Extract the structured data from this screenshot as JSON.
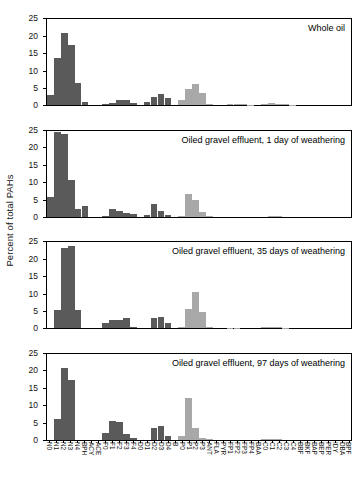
{
  "chart_data": {
    "type": "bar",
    "title": "",
    "ylabel": "Percent of total PAHs",
    "xlabel": "",
    "ylim": [
      0,
      25
    ],
    "yticks": [
      0,
      5,
      10,
      15,
      20,
      25
    ],
    "grid": false,
    "legend": "none",
    "panel_layout": "4 stacked panels sharing x-axis",
    "colors": {
      "dark_gray": "#5a5a5a",
      "light_gray": "#a8a8a8",
      "axis": "#000000"
    },
    "categories": [
      "N0",
      "N1",
      "N2",
      "N3",
      "N4",
      "BPH",
      "ACY",
      "ACE",
      "F0",
      "F1",
      "F2",
      "F3",
      "F4",
      "D0",
      "D1",
      "D2",
      "D3",
      "D4",
      "B",
      "P0",
      "P1",
      "P2",
      "P3",
      "ANT",
      "FLA",
      "PYR",
      "FP1",
      "FP2",
      "FP3",
      "FP4",
      "BAA",
      "C0",
      "C1",
      "C2",
      "C3",
      "C4",
      "BBF",
      "BKF",
      "BAP",
      "BEP",
      "PER",
      "IDY",
      "DBA",
      "BPF"
    ],
    "category_shades": [
      "dark",
      "dark",
      "dark",
      "dark",
      "dark",
      "dark",
      "dark",
      "dark",
      "dark",
      "dark",
      "dark",
      "dark",
      "dark",
      "dark",
      "dark",
      "dark",
      "dark",
      "dark",
      "dark",
      "light",
      "light",
      "light",
      "light",
      "light",
      "light",
      "light",
      "light",
      "light",
      "light",
      "light",
      "light",
      "light",
      "light",
      "light",
      "light",
      "light",
      "light",
      "light",
      "light",
      "light",
      "light",
      "light",
      "light",
      "light"
    ],
    "series": [
      {
        "name": "Whole oil",
        "panel": 1,
        "values": [
          3.0,
          13.8,
          21.0,
          17.5,
          6.5,
          1.0,
          0,
          0,
          0.3,
          0.5,
          1.4,
          1.4,
          0.7,
          0,
          0.9,
          2.4,
          3.2,
          2.1,
          0,
          1.4,
          4.7,
          6.0,
          3.4,
          0.4,
          0,
          0,
          0.2,
          0.2,
          0.2,
          0.1,
          0,
          0.2,
          0.5,
          0.4,
          0.2,
          0.1,
          0,
          0,
          0,
          0,
          0,
          0,
          0,
          0
        ]
      },
      {
        "name": "Oiled gravel effluent, 1 day of weathering",
        "panel": 2,
        "values": [
          5.7,
          24.5,
          24.0,
          10.5,
          2.2,
          3.0,
          0,
          0,
          0.2,
          2.1,
          1.6,
          1.1,
          0.6,
          0,
          0.3,
          3.6,
          1.7,
          0.4,
          0,
          0.2,
          6.5,
          4.7,
          1.2,
          0.1,
          0,
          0,
          0,
          0,
          0,
          0,
          0,
          0,
          0.1,
          0.1,
          0,
          0,
          0,
          0,
          0,
          0,
          0,
          0,
          0,
          0
        ]
      },
      {
        "name": "Oiled gravel effluent, 35 days of weathering",
        "panel": 3,
        "values": [
          0,
          5.1,
          23.2,
          23.8,
          5.3,
          0,
          0,
          0,
          1.4,
          2.3,
          2.4,
          2.9,
          0.4,
          0,
          0,
          3.0,
          3.2,
          1.6,
          0,
          0.2,
          5.6,
          10.5,
          4.6,
          0.2,
          0,
          0,
          0.1,
          0.1,
          0,
          0,
          0,
          0.2,
          0.3,
          0.2,
          0.1,
          0,
          0,
          0,
          0,
          0,
          0,
          0,
          0,
          0
        ]
      },
      {
        "name": "Oiled gravel effluent, 97 days of weathering",
        "panel": 4,
        "values": [
          0,
          6.0,
          20.8,
          17.2,
          0,
          0,
          0,
          0,
          1.8,
          5.5,
          5.1,
          1.6,
          0.4,
          0,
          0,
          3.3,
          3.9,
          1.0,
          0,
          1.0,
          12.0,
          3.3,
          0.3,
          0.2,
          0,
          0,
          0,
          0,
          0,
          0,
          0,
          0.2,
          0.2,
          0.1,
          0,
          0,
          0,
          0,
          0,
          0,
          0,
          0,
          0,
          0
        ]
      }
    ]
  }
}
